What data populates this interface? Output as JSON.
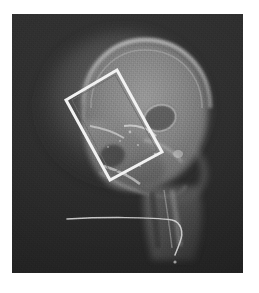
{
  "image": {
    "kind": "x-ray-radiograph",
    "view_label": "Lateral skull radiograph",
    "plate": {
      "x": 12,
      "y": 14,
      "width": 231,
      "height": 259,
      "background_color": "#262626"
    },
    "page": {
      "width": 259,
      "height": 293,
      "background_color": "#ffffff"
    }
  },
  "colors": {
    "plate_background": "#262626",
    "bone_bright": "#b9b9b9",
    "bone_mid": "#8a8a8a",
    "soft_tissue": "#5a5a5a",
    "roi_stroke": "#f2f2f2",
    "roi_inner_stroke": "#6b6b6b",
    "catheter": "#d8d8d8"
  },
  "roi": {
    "label": "region-of-interest-rectangle",
    "shape": "rotated-rectangle",
    "stroke_color": "#f2f2f2",
    "stroke_width": 3,
    "corners": [
      {
        "name": "top",
        "x": 105,
        "y": 56
      },
      {
        "name": "left",
        "x": 54,
        "y": 86
      },
      {
        "name": "bottom",
        "x": 98,
        "y": 166
      },
      {
        "name": "right",
        "x": 150,
        "y": 138
      }
    ]
  },
  "anatomy": {
    "structures": [
      "cranial-vault",
      "frontal-bone",
      "orbit",
      "nasal-bone",
      "maxilla",
      "mandible",
      "sella-turcica",
      "petrous-ridge",
      "cervical-spine",
      "soft-tissue-neck"
    ]
  },
  "catheter": {
    "label": "tube-line-artifact",
    "start_x": 55,
    "start_y": 205,
    "end_x": 165,
    "end_y": 240,
    "color": "#d8d8d8"
  },
  "caption": {
    "text": "",
    "visible": false
  }
}
